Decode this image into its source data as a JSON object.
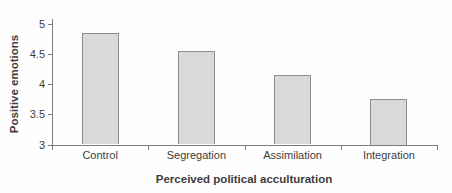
{
  "chart_data": {
    "type": "bar",
    "title": "",
    "categories": [
      "Control",
      "Segregation",
      "Assimilation",
      "Integration"
    ],
    "values": [
      4.85,
      4.55,
      4.15,
      3.75
    ],
    "xlabel": "Perceived political acculturation",
    "ylabel": "Positive emotions",
    "ylim": [
      3,
      5
    ],
    "yticks": [
      3,
      3.5,
      4,
      4.5,
      5
    ],
    "grid": false,
    "legend": "none",
    "colors": {
      "bar_fill": "#d9d9d9",
      "bar_border": "#8c8c8c",
      "axis": "#7d7d7d",
      "text": "#3d3d3d"
    }
  }
}
